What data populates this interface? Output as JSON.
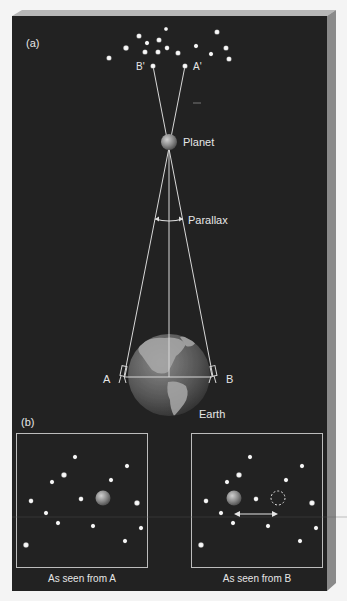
{
  "figure": {
    "panel_a_label": "(a)",
    "panel_b_label": "(b)",
    "star_a_prime": "A'",
    "star_b_prime": "B'",
    "planet_label": "Planet",
    "parallax_label": "Parallax",
    "earth_label": "Earth",
    "point_a": "A",
    "point_b": "B",
    "view_a_caption": "As seen from A",
    "view_b_caption": "As seen from B"
  },
  "colors": {
    "background": "#222222",
    "bevel": "#8a8a8a",
    "star": "#f2f2f2",
    "line": "#d8d8d8",
    "box": "#bdbdbd",
    "planet": "#8c8c8c",
    "earth": "#6e6e6e"
  },
  "stars_top": [
    [
      109,
      58,
      2.6
    ],
    [
      126,
      48,
      2.8
    ],
    [
      139,
      36,
      2.6
    ],
    [
      145,
      52,
      2.6
    ],
    [
      147,
      43,
      2.2
    ],
    [
      158,
      52,
      2.6
    ],
    [
      159,
      40,
      2.6
    ],
    [
      166,
      29,
      2.0
    ],
    [
      167,
      48,
      2.4
    ],
    [
      178,
      53,
      2.6
    ],
    [
      196,
      46,
      2.2
    ],
    [
      211,
      54,
      2.2
    ],
    [
      217,
      32,
      2.6
    ],
    [
      226,
      48,
      2.6
    ],
    [
      229,
      59,
      2.6
    ]
  ],
  "stars_view": [
    [
      59,
      24,
      2.2
    ],
    [
      111,
      33,
      2.2
    ],
    [
      48,
      42,
      2.8
    ],
    [
      36,
      49,
      2.2
    ],
    [
      95,
      47,
      2.2
    ],
    [
      15,
      68,
      2.4
    ],
    [
      65,
      66,
      2.4
    ],
    [
      121,
      70,
      2.8
    ],
    [
      30,
      80,
      2.2
    ],
    [
      42,
      90,
      2.2
    ],
    [
      77,
      93,
      2.2
    ],
    [
      125,
      95,
      2.2
    ],
    [
      109,
      108,
      2.2
    ],
    [
      10,
      112,
      2.8
    ]
  ]
}
